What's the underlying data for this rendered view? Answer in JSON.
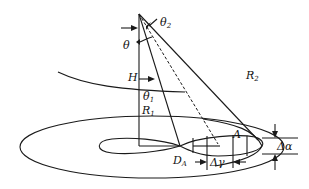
{
  "figure": {
    "type": "geometric diagram"
  },
  "labels": {
    "theta": "θ",
    "theta1": "θ",
    "theta1_sub": "1",
    "theta2": "θ",
    "theta2_sub": "2",
    "H": "H",
    "R1": "R",
    "R1_sub": "1",
    "R2": "R",
    "R2_sub": "2",
    "A": "A",
    "DA": "D",
    "DA_sub": "A",
    "delta_gamma": "Δγ",
    "delta_alpha": "Δα"
  },
  "colors": {
    "line": "#1a1a1a",
    "background": "#ffffff"
  }
}
